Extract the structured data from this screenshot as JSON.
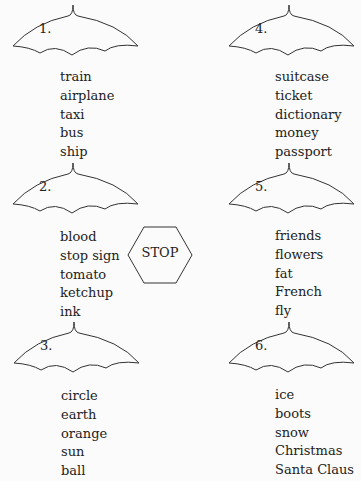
{
  "umbrellas": [
    {
      "number": "1.",
      "words": [
        "train",
        "airplane",
        "taxi",
        "bus",
        "ship"
      ]
    },
    {
      "number": "2.",
      "words": [
        "blood",
        "stop sign",
        "tomato",
        "ketchup",
        "ink"
      ]
    },
    {
      "number": "3.",
      "words": [
        "circle",
        "earth",
        "orange",
        "sun",
        "ball"
      ]
    },
    {
      "number": "4.",
      "words": [
        "suitcase",
        "ticket",
        "dictionary",
        "money",
        "passport"
      ]
    },
    {
      "number": "5.",
      "words": [
        "friends",
        "flowers",
        "fat",
        "French",
        "fly"
      ]
    },
    {
      "number": "6.",
      "words": [
        "ice",
        "boots",
        "snow",
        "Christmas",
        "Santa Claus"
      ]
    }
  ],
  "stop_sign": {
    "label": "STOP"
  },
  "colors": {
    "line": "#333333",
    "text": "#222222",
    "background": "#fbfbfb"
  }
}
